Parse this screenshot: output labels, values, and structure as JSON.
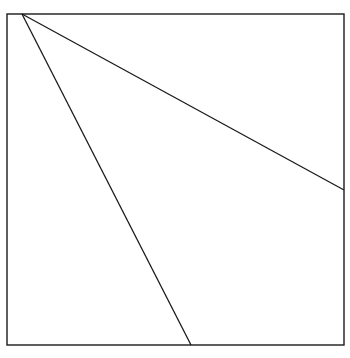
{
  "figure": {
    "type": "line-drawing",
    "canvas": {
      "width": 350,
      "height": 358,
      "background": "#ffffff"
    },
    "frame": {
      "name": "square-border",
      "x": 7,
      "y": 14,
      "width": 337,
      "height": 331,
      "stroke": "#1a1a1a",
      "stroke_width": 1.4,
      "fill": "#ffffff"
    },
    "vertex": {
      "label": "apex",
      "x": 34,
      "y": 34
    },
    "lines": [
      {
        "name": "shallow-line",
        "description": "Long gently sloping line from apex to right border",
        "x1": 22,
        "y1": 14,
        "x2": 344,
        "y2": 190,
        "stroke": "#1a1a1a",
        "stroke_width": 1.3,
        "slope": 0.55
      },
      {
        "name": "steep-line",
        "description": "Steep line from top border through apex to bottom border",
        "x1": 22,
        "y1": 14,
        "x2": 191,
        "y2": 345,
        "stroke": "#1a1a1a",
        "stroke_width": 1.3,
        "slope": 1.96
      }
    ]
  },
  "chart_data": {
    "type": "line",
    "title": "",
    "xlabel": "",
    "ylabel": "",
    "grid": false,
    "legend": "none",
    "xlim": [
      7,
      344
    ],
    "ylim": [
      14,
      345
    ],
    "series": [
      {
        "name": "shallow-line",
        "x": [
          22,
          344
        ],
        "y": [
          14,
          190
        ]
      },
      {
        "name": "steep-line",
        "x": [
          22,
          191
        ],
        "y": [
          14,
          345
        ]
      }
    ],
    "annotations": []
  }
}
